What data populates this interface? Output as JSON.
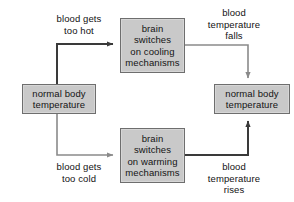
{
  "diagram": {
    "type": "flowchart",
    "colors": {
      "box_fill": "#c9c9c9",
      "box_border": "#6e6e6e",
      "line": "#3a3a3a",
      "text": "#141414",
      "background": "#ffffff"
    },
    "nodes": {
      "normal_left": "normal body\ntemperature",
      "cooling": "brain\nswitches\non cooling\nmechanisms",
      "warming": "brain\nswitches\non warming\nmechanisms",
      "normal_right": "normal body\ntemperature"
    },
    "edge_labels": {
      "too_hot": "blood gets\ntoo hot",
      "too_cold": "blood gets\ntoo cold",
      "temperature_falls": "blood\ntemperature\nfalls",
      "temperature_rises": "blood\ntemperature\nrises"
    }
  }
}
